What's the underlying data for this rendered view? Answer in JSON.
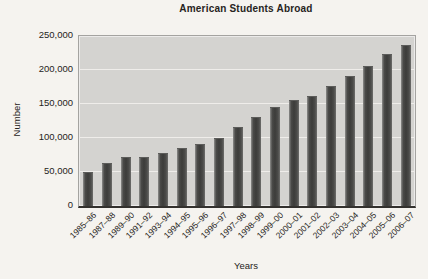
{
  "chart_data": {
    "type": "bar",
    "title": "American Students Abroad",
    "xlabel": "Years",
    "ylabel": "Number",
    "categories": [
      "1985–86",
      "1987–88",
      "1989–90",
      "1991–92",
      "1993–94",
      "1994–95",
      "1995–96",
      "1996–97",
      "1997–98",
      "1998–99",
      "1999–00",
      "2000–01",
      "2001–02",
      "2002–03",
      "2003–04",
      "2004–05",
      "2005–06",
      "2006–07"
    ],
    "values": [
      48000,
      62000,
      71000,
      71000,
      76000,
      84000,
      89000,
      99000,
      114000,
      130000,
      144000,
      154000,
      161000,
      175000,
      190000,
      205000,
      222000,
      235000
    ],
    "ylim": [
      0,
      250000
    ],
    "ytick_interval": 50000,
    "ytick_labels": [
      "0",
      "50,000",
      "100,000",
      "150,000",
      "200,000",
      "250,000"
    ],
    "grid": "horizontal",
    "legend": "none",
    "bar_color": "#434341",
    "plot_bg": "#d4d3d0",
    "page_bg": "#f5f3ef",
    "axis_color": "#33312e"
  }
}
